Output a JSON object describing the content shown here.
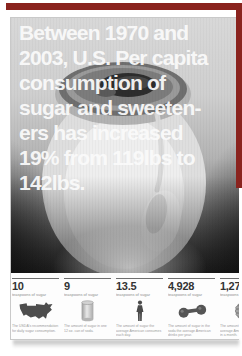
{
  "accent": {
    "red": "#8a231e"
  },
  "poster": {
    "headline_lines": [
      "Between 1970 and",
      "2003, U.S. Per capita",
      "consumption of",
      "sugar and sweeten-",
      "ers has increased",
      "19% from 119lbs to",
      "142lbs."
    ],
    "stats": {
      "columns": [
        {
          "value": "10",
          "unit": "teaspoons of sugar",
          "icon": "us-map-icon",
          "caption": "The USDA's recommendation for daily sugar consumption."
        },
        {
          "value": "9",
          "unit": "teaspoons of sugar",
          "icon": "soda-can-icon",
          "caption": "The amount of sugar in one 12 oz. can of soda."
        },
        {
          "value": "13.5",
          "unit": "teaspoons of sugar",
          "icon": "person-icon",
          "caption": "The amount of sugar the average American consumes each day."
        },
        {
          "value": "4,928",
          "unit": "teaspoons of sugar",
          "icon": "dumbbell-icon",
          "caption": "The amount of sugar in the soda the average American drinks per year."
        },
        {
          "value": "1,278",
          "unit": "teaspoons of sugar",
          "icon": "ball-icon",
          "caption": "The amount of sugar the average American consumes in a month."
        }
      ]
    }
  }
}
